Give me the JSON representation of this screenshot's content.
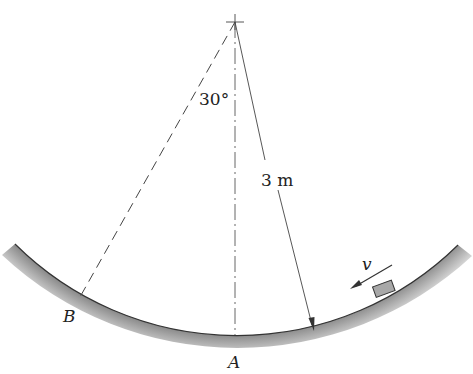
{
  "diagram": {
    "angle_label": "30°",
    "radius_label": "3 m",
    "velocity_label": "v",
    "point_a_label": "A",
    "point_b_label": "B",
    "radius_m": 3,
    "angle_deg": 30,
    "colors": {
      "line": "#333333",
      "ground_shade": "#9a9a9a",
      "block_fill": "#a8a8a8"
    }
  }
}
